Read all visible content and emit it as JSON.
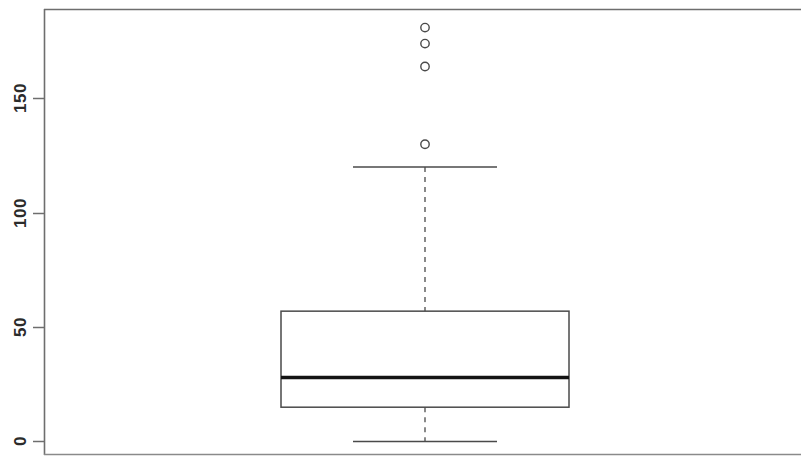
{
  "figure": {
    "width": 801,
    "height": 460,
    "background_color": "#ffffff",
    "frame_color": "#6e6e6e",
    "ink_color": "#3a3a3a",
    "median_color": "#1a1a1a"
  },
  "axis": {
    "y_tick_labels": [
      "0",
      "50",
      "100",
      "150"
    ],
    "y_tick_values": [
      0,
      50,
      100,
      150
    ],
    "y_label": "",
    "x_label": "",
    "orientation": "vertical",
    "tick_label_rotation": 90
  },
  "chart_data": {
    "type": "box",
    "title": "",
    "xlabel": "",
    "ylabel": "",
    "ylim": [
      -6,
      190
    ],
    "xlim": [
      0,
      1
    ],
    "grid": false,
    "legend": null,
    "categories": [
      ""
    ],
    "boxes": [
      {
        "name": "",
        "q1": 15,
        "median": 28,
        "q3": 57,
        "whisker_low": 0,
        "whisker_high": 120,
        "outliers": [
          130,
          164,
          174,
          181
        ],
        "box_left_px": 281,
        "box_right_px": 569,
        "center_px": 425,
        "whisker_cap_left_px": 353,
        "whisker_cap_right_px": 497
      }
    ]
  }
}
